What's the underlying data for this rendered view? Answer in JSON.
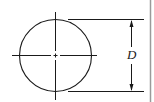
{
  "diagram": {
    "type": "circle-diameter-dimension",
    "dimension_label": "D",
    "colors": {
      "line": "#1a1a1a",
      "background": "#ffffff",
      "border": "#9a9a9a"
    }
  }
}
